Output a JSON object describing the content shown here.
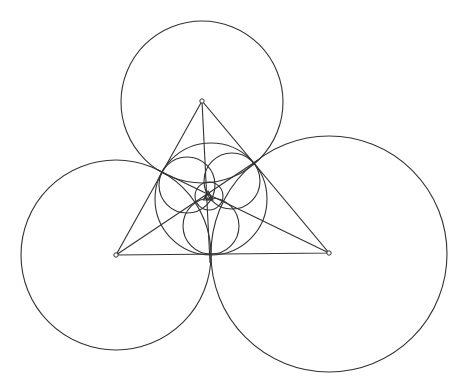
{
  "diagram": {
    "type": "geometric-construction",
    "stroke_color": "#333333",
    "background": "#ffffff",
    "vertices": [
      {
        "name": "A",
        "x": 202,
        "y": 101
      },
      {
        "name": "B",
        "x": 116,
        "y": 255
      },
      {
        "name": "C",
        "x": 329,
        "y": 253
      }
    ],
    "vertex_circles": [
      {
        "name": "circle-A",
        "cx": 202,
        "cy": 102,
        "r": 81
      },
      {
        "name": "circle-B",
        "cx": 116,
        "cy": 255,
        "r": 95
      },
      {
        "name": "circle-C",
        "cx": 329,
        "cy": 254,
        "r": 118
      }
    ],
    "incircle": {
      "cx": 211,
      "cy": 199,
      "r": 56
    },
    "petal_circles": [
      {
        "name": "petal-left",
        "cx": 187,
        "cy": 185,
        "r": 28
      },
      {
        "name": "petal-right",
        "cx": 232,
        "cy": 181,
        "r": 28
      },
      {
        "name": "petal-bottom",
        "cx": 211,
        "cy": 226,
        "r": 28
      }
    ],
    "inner_soddy_circle": {
      "cx": 209,
      "cy": 196,
      "r": 14
    },
    "tiny_triangle": [
      [
        203.5,
        200
      ],
      [
        213,
        200
      ],
      [
        208,
        191
      ]
    ],
    "tiny_circle": {
      "cx": 208,
      "cy": 197,
      "r": 2.6
    },
    "cevians": [
      {
        "name": "cevian-A",
        "x1": 202,
        "y1": 101,
        "x2": 210,
        "y2": 263
      },
      {
        "name": "cevian-B",
        "x1": 116,
        "y1": 255,
        "x2": 258,
        "y2": 160
      },
      {
        "name": "cevian-C",
        "x1": 329,
        "y1": 253,
        "x2": 158,
        "y2": 170
      }
    ]
  }
}
